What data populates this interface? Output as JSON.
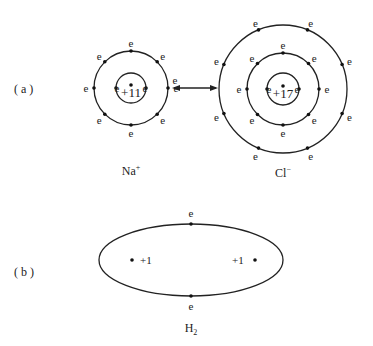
{
  "figure": {
    "panel_a": {
      "label": "( a )",
      "arrow": "double-headed-arrow",
      "sodium": {
        "ion_label": "Na",
        "ion_charge": "+",
        "nucleus_charge": "+11",
        "shells": [
          {
            "electrons": 2,
            "label": "e"
          },
          {
            "electrons": 8,
            "label": "e"
          }
        ],
        "transferred_electron_label": "e"
      },
      "chlorine": {
        "ion_label": "Cl",
        "ion_charge": "−",
        "nucleus_charge": "+17",
        "shells": [
          {
            "electrons": 2,
            "label": "e"
          },
          {
            "electrons": 8,
            "label": "e"
          },
          {
            "electrons": 8,
            "label": "e"
          }
        ]
      }
    },
    "panel_b": {
      "label": "( b )",
      "molecule_label": "H",
      "molecule_subscript": "2",
      "nuclei": [
        "+1",
        "+1"
      ],
      "shared_electrons": [
        "e",
        "e"
      ]
    }
  }
}
